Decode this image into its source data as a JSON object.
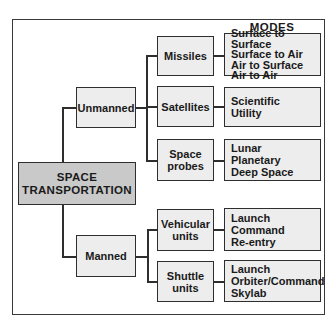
{
  "header_fragment": "",
  "modes_label": "MODES",
  "root": {
    "line1": "SPACE",
    "line2": "TRANSPORTATION"
  },
  "branches": [
    {
      "label": "Unmanned",
      "children": [
        {
          "label_lines": [
            "Missiles"
          ],
          "modes": [
            "Surface to Surface",
            "Surface to Air",
            "Air to Surface",
            "Air to Air"
          ]
        },
        {
          "label_lines": [
            "Satellites"
          ],
          "modes": [
            "Scientific",
            "Utility"
          ]
        },
        {
          "label_lines": [
            "Space",
            "probes"
          ],
          "modes": [
            "Lunar",
            "Planetary",
            "Deep Space"
          ]
        }
      ]
    },
    {
      "label": "Manned",
      "children": [
        {
          "label_lines": [
            "Vehicular",
            "units"
          ],
          "modes": [
            "Launch",
            "Command",
            "Re-entry"
          ]
        },
        {
          "label_lines": [
            "Shuttle",
            "units"
          ],
          "modes": [
            "Launch",
            "Orbiter/Command",
            "Skylab"
          ]
        }
      ]
    }
  ],
  "colors": {
    "root_fill": "#c9c9c9",
    "box_fill": "#ededed",
    "stroke": "#2e2e2e"
  }
}
